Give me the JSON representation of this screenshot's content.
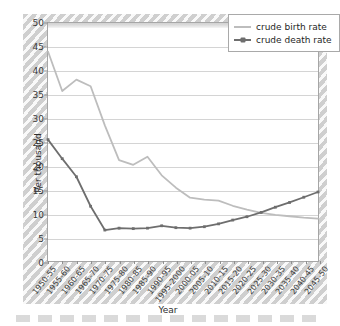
{
  "chart_data": {
    "type": "line",
    "title": "",
    "xlabel": "Year",
    "ylabel": "Per thousand",
    "ylim": [
      0,
      50
    ],
    "ytick_step": 5,
    "yticks": [
      0,
      5,
      10,
      15,
      20,
      25,
      30,
      35,
      40,
      45,
      50
    ],
    "grid": true,
    "legend_position": "top-right",
    "categories": [
      "1950-55",
      "1955-60",
      "1960-65",
      "1965-70",
      "1970-75",
      "1975-80",
      "1980-85",
      "1985-90",
      "1990-95",
      "1995-2000",
      "2000-05",
      "2005-10",
      "2010-15",
      "2015-20",
      "2020-25",
      "2025-30",
      "2030-35",
      "2035-40",
      "2040-45",
      "2045-50"
    ],
    "series": [
      {
        "name": "crude birth rate",
        "color": "#bdbdbd",
        "marker": "none",
        "values": [
          44.0,
          35.7,
          38.1,
          36.7,
          28.5,
          21.2,
          20.2,
          21.9,
          18.0,
          15.4,
          13.3,
          12.9,
          12.7,
          11.6,
          10.8,
          10.1,
          9.7,
          9.4,
          9.1,
          8.9
        ]
      },
      {
        "name": "crude death rate",
        "color": "#6e6e6e",
        "marker": "square",
        "values": [
          25.5,
          21.5,
          17.7,
          11.5,
          6.5,
          6.9,
          6.8,
          6.9,
          7.4,
          7.0,
          6.9,
          7.2,
          7.8,
          8.6,
          9.3,
          10.2,
          11.3,
          12.3,
          13.4,
          14.5
        ]
      }
    ]
  },
  "legend": {
    "items": [
      {
        "label": "crude birth rate"
      },
      {
        "label": "crude death rate"
      }
    ]
  },
  "axes": {
    "y_title": "Per thousand",
    "x_title": "Year"
  },
  "colors": {
    "birth_rate": "#bdbdbd",
    "death_rate": "#6e6e6e",
    "grid": "#d4d4d4",
    "frame": "#a6a6a6",
    "page": "#d7d7d7"
  }
}
